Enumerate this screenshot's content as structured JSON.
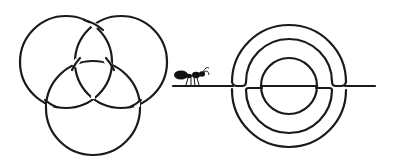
{
  "figure": {
    "background": "#ffffff",
    "ink_color": "#1a1a1a",
    "left_figure": {
      "label": "three-interlinked-circles",
      "circles": [
        {
          "name": "left",
          "cx": 66,
          "cy": 62,
          "r": 46
        },
        {
          "name": "right",
          "cx": 121,
          "cy": 62,
          "r": 46
        },
        {
          "name": "bottom",
          "cx": 93,
          "cy": 108,
          "r": 47
        }
      ]
    },
    "right_figure": {
      "label": "concentric-circles-on-line",
      "center": {
        "cx": 289,
        "cy": 86
      },
      "radii": [
        57,
        43,
        28
      ],
      "baseline": {
        "x1": 173,
        "x2": 375,
        "y": 86
      }
    },
    "ant": {
      "label": "ant",
      "x": 175,
      "y": 70
    }
  }
}
